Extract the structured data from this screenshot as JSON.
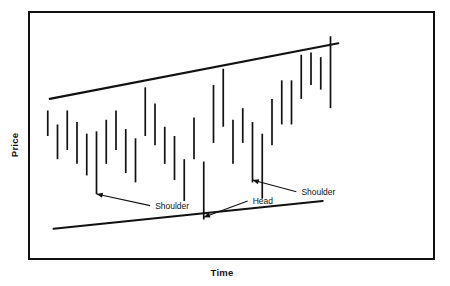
{
  "chart_data": {
    "type": "bar",
    "title": "",
    "subtitle": "",
    "xlabel": "Time",
    "ylabel": "Price",
    "grid": false,
    "legend_position": "none",
    "xlim": [
      0,
      40
    ],
    "ylim": [
      0,
      100
    ],
    "axis_ticks": {
      "x": [],
      "y": []
    },
    "series": [
      {
        "name": "Price range bars",
        "type": "high-low-bars",
        "x": [
          1,
          2,
          3,
          4,
          5,
          6,
          7,
          8,
          9,
          10,
          11,
          12,
          13,
          14,
          15,
          16,
          17,
          18,
          19,
          20,
          21,
          22,
          23,
          24,
          25,
          26,
          27,
          28,
          29,
          30
        ],
        "high": [
          61,
          55,
          61,
          56,
          51,
          52,
          57,
          61,
          53,
          49,
          71,
          64,
          54,
          50,
          40,
          58,
          39,
          72,
          79,
          57,
          62,
          56,
          51,
          66,
          74,
          74,
          85,
          86,
          84,
          93
        ],
        "low": [
          50,
          40,
          44,
          38,
          33,
          25,
          38,
          44,
          34,
          30,
          50,
          46,
          38,
          31,
          22,
          40,
          14,
          47,
          54,
          38,
          47,
          30,
          23,
          46,
          55,
          55,
          66,
          72,
          70,
          62
        ]
      }
    ],
    "trendlines": [
      {
        "name": "upper-resistance-trendline",
        "label": "Upper channel line",
        "points": [
          [
            1.2,
            66
          ],
          [
            30.8,
            90
          ]
        ]
      },
      {
        "name": "lower-support-trendline",
        "label": "Lower channel line",
        "points": [
          [
            1.6,
            10
          ],
          [
            29.2,
            22
          ]
        ]
      }
    ],
    "annotations": [
      {
        "id": "left-shoulder",
        "label": "Shoulder",
        "target_x": 6,
        "target_y": 25,
        "text_x": 11.5,
        "text_y": 20
      },
      {
        "id": "head",
        "label": "Head",
        "target_x": 17,
        "target_y": 15,
        "text_x": 21.5,
        "text_y": 22
      },
      {
        "id": "right-shoulder",
        "label": "Shoulder",
        "target_x": 22,
        "target_y": 31,
        "text_x": 26.5,
        "text_y": 26
      }
    ],
    "colors": {
      "bar": "#111111",
      "trendline": "#111111",
      "frame": "#111111",
      "background": "#ffffff",
      "text": "#111111"
    }
  },
  "axes": {
    "y_title": "Price",
    "x_title": "Time"
  },
  "labels": {
    "shoulder_left": "Shoulder",
    "head": "Head",
    "shoulder_right": "Shoulder"
  }
}
